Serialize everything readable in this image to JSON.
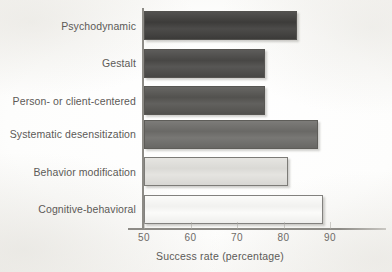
{
  "chart_data": {
    "type": "bar",
    "orientation": "horizontal",
    "title": "",
    "xlabel": "Success rate (percentage)",
    "ylabel": "",
    "xlim": [
      50,
      95
    ],
    "xticks": [
      50,
      60,
      70,
      80,
      90
    ],
    "xtick_labels": [
      "50",
      "60",
      "70",
      "80",
      "90"
    ],
    "grid": false,
    "legend": false,
    "categories": [
      "Psychodynamic",
      "Gestalt",
      "Person- or client-centered",
      "Systematic desensitization",
      "Behavior modification",
      "Cognitive-behavioral"
    ],
    "values": [
      83,
      76,
      76,
      87.5,
      81,
      88.5
    ],
    "bar_colors": [
      "#3f3e3c",
      "#4b4a48",
      "#565552",
      "#6e6d6a",
      "#e3e2de",
      "#fbfbf9"
    ]
  },
  "axis": {
    "x_title": "Success rate (percentage)",
    "ticks": [
      "50",
      "60",
      "70",
      "80",
      "90"
    ]
  },
  "bars": [
    {
      "label": "Psychodynamic",
      "value": 83,
      "color": "#3f3e3c"
    },
    {
      "label": "Gestalt",
      "value": 76,
      "color": "#4b4a48"
    },
    {
      "label": "Person- or client-centered",
      "value": 76,
      "color": "#565552"
    },
    {
      "label": "Systematic desensitization",
      "value": 87.5,
      "color": "#6e6d6a"
    },
    {
      "label": "Behavior modification",
      "value": 81,
      "color": "#e3e2de"
    },
    {
      "label": "Cognitive-behavioral",
      "value": 88.5,
      "color": "#fbfbf9"
    }
  ]
}
